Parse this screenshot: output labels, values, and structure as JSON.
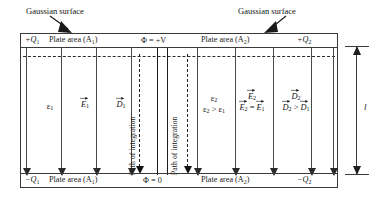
{
  "diagram": {
    "annotations": {
      "gaussian_surface_left": "Gaussian surface",
      "gaussian_surface_right": "Gaussian surface"
    },
    "top_plate": {
      "charge_left": "+Q",
      "charge_left_sub": "1",
      "area_left": "Plate area (A",
      "area_left_sub": "1",
      "area_left_close": ")",
      "potential": "Φ = +V",
      "area_right": "Plate area (A",
      "area_right_sub": "2",
      "area_right_close": ")",
      "charge_right": "+Q",
      "charge_right_sub": "2"
    },
    "bottom_plate": {
      "charge_left": "−Q",
      "charge_left_sub": "1",
      "area_left": "Plate area (A",
      "area_left_sub": "1",
      "area_left_close": ")",
      "potential": "Φ = 0",
      "area_right": "Plate area (A",
      "area_right_sub": "2",
      "area_right_close": ")",
      "charge_right": "−Q",
      "charge_right_sub": "2"
    },
    "left_region": {
      "permittivity": "ε",
      "permittivity_sub": "1",
      "e_field": "E",
      "e_field_sub": "1",
      "d_field": "D",
      "d_field_sub": "1"
    },
    "right_region": {
      "permittivity": "ε",
      "permittivity_sub": "2",
      "permittivity_relation_lhs": "ε",
      "permittivity_relation_lhs_sub": "2",
      "permittivity_relation_op": " > ",
      "permittivity_relation_rhs": "ε",
      "permittivity_relation_rhs_sub": "1",
      "e_field": "E",
      "e_field_sub": "2",
      "e_relation_lhs": "E",
      "e_relation_lhs_sub": "2",
      "e_relation_op": " = ",
      "e_relation_rhs": "E",
      "e_relation_rhs_sub": "1",
      "d_field": "D",
      "d_field_sub": "2",
      "d_relation_lhs": "D",
      "d_relation_lhs_sub": "2",
      "d_relation_op": " > ",
      "d_relation_rhs": "D",
      "d_relation_rhs_sub": "1"
    },
    "path_labels": {
      "left": "Path of integration",
      "right": "Path of integration"
    },
    "dimension": {
      "separation_label": "l"
    },
    "colors": {
      "ink": "#1a1a1a",
      "rule": "#3a3a3a",
      "arrow": "#111111",
      "background": "#ffffff"
    }
  }
}
